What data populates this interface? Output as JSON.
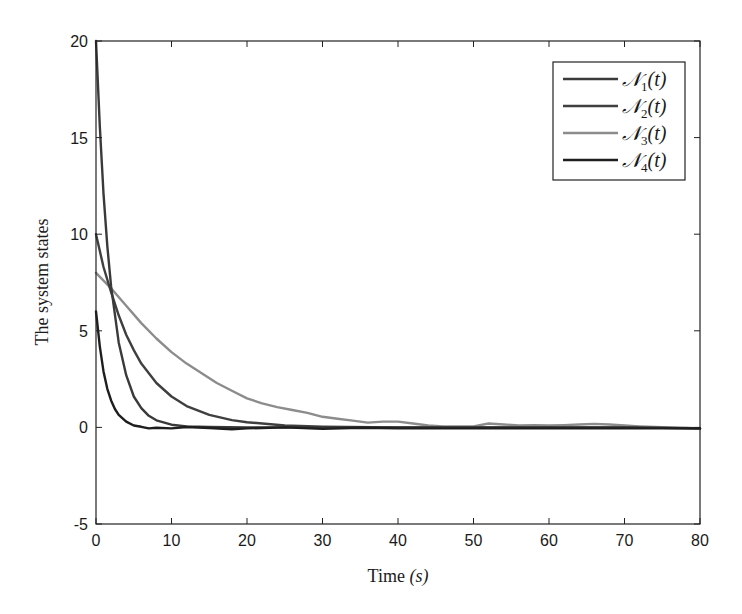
{
  "chart_data": {
    "type": "line",
    "title": "",
    "xlabel": "Time (s)",
    "xlabel_parts": {
      "text": "Time ",
      "var": "(s)"
    },
    "ylabel": "The system states",
    "xlim": [
      0,
      80
    ],
    "ylim": [
      -5,
      20
    ],
    "xticks": [
      0,
      10,
      20,
      30,
      40,
      50,
      60,
      70,
      80
    ],
    "yticks": [
      -5,
      0,
      5,
      10,
      15,
      20
    ],
    "xtick_labels": [
      "0",
      "10",
      "20",
      "30",
      "40",
      "50",
      "60",
      "70",
      "80"
    ],
    "ytick_labels": [
      "-5",
      "0",
      "5",
      "10",
      "15",
      "20"
    ],
    "grid": false,
    "legend_position": "upper right",
    "series": [
      {
        "name": "N1(t)",
        "label_main": "𝒩",
        "label_sub": "1",
        "label_tail": "(t)",
        "color": "#3a3a3a",
        "x": [
          0,
          0.5,
          1,
          1.5,
          2,
          3,
          4,
          5,
          6,
          7,
          8,
          10,
          12,
          15,
          20,
          30,
          40,
          50,
          60,
          70,
          80
        ],
        "y": [
          20,
          15.6,
          12.1,
          9.4,
          7.3,
          4.4,
          2.7,
          1.6,
          1.0,
          0.6,
          0.37,
          0.14,
          0.05,
          0.02,
          0.0,
          0.0,
          0.0,
          0.0,
          0.0,
          0.0,
          -0.05
        ]
      },
      {
        "name": "N2(t)",
        "label_main": "𝒩",
        "label_sub": "2",
        "label_tail": "(t)",
        "color": "#3f3f3f",
        "x": [
          0,
          1,
          2,
          3,
          4,
          5,
          6,
          8,
          10,
          12,
          15,
          18,
          20,
          25,
          30,
          40,
          50,
          60,
          70,
          80
        ],
        "y": [
          10,
          8.3,
          7.0,
          5.8,
          4.8,
          4.0,
          3.3,
          2.3,
          1.6,
          1.1,
          0.65,
          0.38,
          0.27,
          0.1,
          0.04,
          0.0,
          0.0,
          0.0,
          0.0,
          -0.05
        ]
      },
      {
        "name": "N3(t)",
        "label_main": "𝒩",
        "label_sub": "3",
        "label_tail": "(t)",
        "color": "#8c8c8c",
        "x": [
          0,
          2,
          4,
          6,
          8,
          10,
          12,
          14,
          16,
          18,
          20,
          22,
          24,
          26,
          28,
          30,
          32,
          34,
          36,
          38,
          40,
          42,
          44,
          46,
          48,
          50,
          52,
          54,
          56,
          58,
          60,
          62,
          64,
          66,
          68,
          70,
          72,
          74,
          76,
          78,
          80
        ],
        "y": [
          8.0,
          7.2,
          6.3,
          5.4,
          4.6,
          3.9,
          3.3,
          2.8,
          2.3,
          1.9,
          1.5,
          1.25,
          1.05,
          0.9,
          0.75,
          0.55,
          0.45,
          0.35,
          0.25,
          0.3,
          0.3,
          0.2,
          0.1,
          0.05,
          0.05,
          0.05,
          0.2,
          0.15,
          0.1,
          0.12,
          0.1,
          0.12,
          0.15,
          0.18,
          0.15,
          0.1,
          0.05,
          0.02,
          0.0,
          -0.02,
          -0.05
        ]
      },
      {
        "name": "N4(t)",
        "label_main": "𝒩",
        "label_sub": "4",
        "label_tail": "(t)",
        "color": "#1e1e1e",
        "x": [
          0,
          0.5,
          1,
          1.5,
          2,
          2.5,
          3,
          4,
          5,
          6,
          7,
          8,
          10,
          12,
          15,
          18,
          20,
          25,
          30,
          35,
          40,
          50,
          60,
          70,
          80
        ],
        "y": [
          6,
          4.2,
          2.9,
          2.0,
          1.4,
          0.95,
          0.65,
          0.3,
          0.1,
          0.03,
          -0.05,
          -0.02,
          -0.05,
          0.02,
          -0.03,
          -0.1,
          -0.05,
          0.0,
          -0.08,
          -0.02,
          -0.05,
          -0.05,
          -0.05,
          -0.05,
          -0.05
        ]
      }
    ]
  }
}
